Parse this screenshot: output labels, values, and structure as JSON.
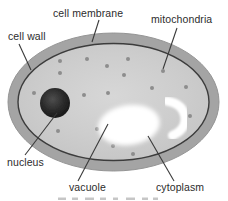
{
  "diagram": {
    "type": "labeled-cell-diagram",
    "background_color": "#ffffff",
    "label_color": "#2c2c2c",
    "leader_line_color": "#3a3a3a",
    "cell": {
      "wall_color": "#a4a4a4",
      "wall_edge_color": "#959595",
      "membrane_color": "#3c3c3c",
      "cytoplasm_color": "#cbcbcb",
      "cytoplasm_highlight_color": "#d7d7d7",
      "nucleus_color": "#1a1a1a",
      "nucleus_highlight_color": "#4e4e4e",
      "organelle_dot_color": "#8d8d8d",
      "vacuole_color": "#ffffff",
      "mitochondrion_shape_color": "#ffffff"
    },
    "labels": [
      {
        "text": "cell wall",
        "target": "cell-wall",
        "leader": [
          19,
          44,
          31,
          70
        ]
      },
      {
        "text": "cell membrane",
        "target": "cell-membrane",
        "leader": [
          99,
          20,
          92,
          42
        ]
      },
      {
        "text": "mitochondria",
        "target": "mitochondria",
        "leader": [
          177,
          28,
          163,
          69
        ]
      },
      {
        "text": "nucleus",
        "target": "nucleus",
        "leader": [
          57,
          113,
          25,
          155
        ]
      },
      {
        "text": "vacuole",
        "target": "vacuole",
        "leader": [
          108,
          124,
          78,
          181
        ]
      },
      {
        "text": "cytoplasm",
        "target": "cytoplasm",
        "leader": [
          148,
          136,
          174,
          181
        ]
      }
    ],
    "organelle_dots": [
      [
        60,
        61
      ],
      [
        87,
        59
      ],
      [
        128,
        59
      ],
      [
        107,
        66
      ],
      [
        60,
        73
      ],
      [
        124,
        75
      ],
      [
        34,
        93
      ],
      [
        84,
        95
      ],
      [
        108,
        93
      ],
      [
        152,
        88
      ],
      [
        186,
        87
      ],
      [
        190,
        116
      ],
      [
        58,
        131
      ],
      [
        97,
        129
      ],
      [
        113,
        146
      ],
      [
        133,
        154
      ],
      [
        163,
        71
      ]
    ]
  }
}
